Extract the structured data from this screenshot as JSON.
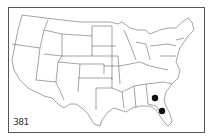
{
  "map": {
    "type": "range-map",
    "region": "Contiguous United States",
    "figure_number": "381",
    "marker_color": "#111111",
    "outline_color": "#555555",
    "markers": [
      {
        "state": "Georgia",
        "x": 155,
        "y": 98
      },
      {
        "state": "Florida",
        "x": 162,
        "y": 111
      }
    ]
  }
}
